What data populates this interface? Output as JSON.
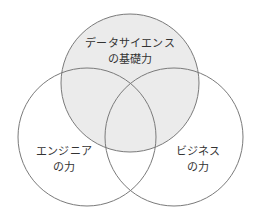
{
  "diagram": {
    "type": "venn",
    "colors": {
      "stroke": "#7a7a7a",
      "highlight_fill": "#ebebeb",
      "background": "#ffffff",
      "text": "#333333"
    },
    "circles": [
      {
        "id": "data-science",
        "cx": 130,
        "cy": 83,
        "r": 69,
        "highlighted": true,
        "label_lines": [
          "データサイエンス",
          "の基礎力"
        ]
      },
      {
        "id": "engineering",
        "cx": 87,
        "cy": 137,
        "r": 69,
        "highlighted": false,
        "label_lines": [
          "エンジニア",
          "の力"
        ]
      },
      {
        "id": "business",
        "cx": 174,
        "cy": 137,
        "r": 69,
        "highlighted": false,
        "label_lines": [
          "ビジネス",
          "の力"
        ]
      }
    ]
  }
}
